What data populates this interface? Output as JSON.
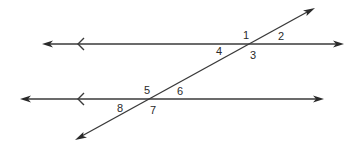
{
  "diagram": {
    "stroke_color": "#3a3a3a",
    "lines": [
      {
        "id": "top-line",
        "x1": 42,
        "y1": 44,
        "x2": 343,
        "y2": 44,
        "parallel_marker_x": 78
      },
      {
        "id": "bottom-line",
        "x1": 20,
        "y1": 99,
        "x2": 323,
        "y2": 99,
        "parallel_marker_x": 78
      },
      {
        "id": "transversal",
        "x1": 75,
        "y1": 140,
        "x2": 315,
        "y2": 8
      }
    ],
    "angle_labels": [
      {
        "text": "1",
        "x": 243,
        "y": 39
      },
      {
        "text": "2",
        "x": 278,
        "y": 40
      },
      {
        "text": "4",
        "x": 216,
        "y": 55
      },
      {
        "text": "3",
        "x": 250,
        "y": 59
      },
      {
        "text": "5",
        "x": 144,
        "y": 94
      },
      {
        "text": "6",
        "x": 177,
        "y": 95
      },
      {
        "text": "8",
        "x": 117,
        "y": 112
      },
      {
        "text": "7",
        "x": 150,
        "y": 114
      }
    ]
  }
}
